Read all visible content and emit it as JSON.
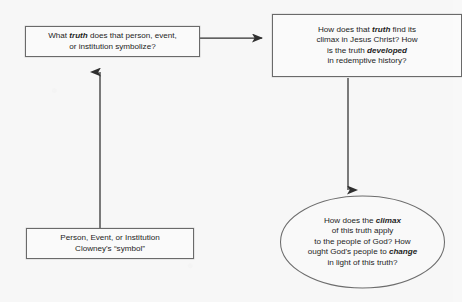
{
  "diagram": {
    "background_color": "#f7f7f7",
    "stroke_color": "#3a3a3a",
    "box_border_color": "#6a6a6a",
    "nodes": {
      "symbol_source": {
        "shape": "rectangle",
        "line1": "Person, Event, or Institution",
        "line2": "Clowney's “symbol”",
        "text": "Person, Event, or Institution\nClowney's “symbol”"
      },
      "symbolize": {
        "shape": "rectangle",
        "text_before_emphasis": "What ",
        "emphasis": "truth",
        "text_after_emphasis": " does that person, event,\nor institution symbolize?"
      },
      "climax_development": {
        "shape": "rectangle",
        "segment1": "How does that ",
        "emphasis1": "truth",
        "segment2": " find its\nclimax in Jesus Christ? How\nis the truth ",
        "emphasis2": "developed",
        "segment3": "\nin redemptive history?"
      },
      "application": {
        "shape": "oval",
        "segment1": "How does the ",
        "emphasis1": "climax",
        "segment2": "\nof this truth apply\nto the people of God? How\nought God's people to ",
        "emphasis2": "change",
        "segment3": "\nin light of this truth?"
      }
    },
    "arrows": [
      {
        "name": "arrow-up",
        "label": "",
        "from": "symbol-source",
        "to": "symbolize",
        "direction": "up"
      },
      {
        "name": "arrow-right",
        "label": "",
        "from": "symbolize",
        "to": "climax-development",
        "direction": "right"
      },
      {
        "name": "arrow-down",
        "label": "",
        "from": "climax-development",
        "to": "application",
        "direction": "down"
      }
    ]
  }
}
